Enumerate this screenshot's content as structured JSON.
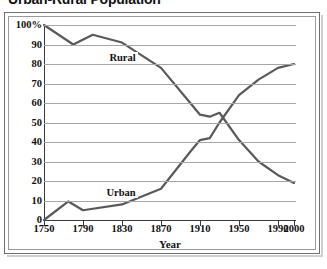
{
  "title": "Urban-Rural Population",
  "chart_data": {
    "type": "line",
    "title": "Urban-Rural Population",
    "xlabel": "Year",
    "ylabel": "",
    "xlim": [
      1750,
      2000
    ],
    "ylim": [
      0,
      100
    ],
    "grid": true,
    "legend": "inline-labels",
    "y_ticks": [
      "100%",
      "90",
      "80",
      "70",
      "60",
      "50",
      "40",
      "30",
      "20",
      "10",
      "0"
    ],
    "y_tick_values": [
      100,
      90,
      80,
      70,
      60,
      50,
      40,
      30,
      20,
      10,
      0
    ],
    "x_ticks": [
      "1750",
      "1790",
      "1830",
      "1870",
      "1910",
      "1950",
      "1990",
      "2000"
    ],
    "x_tick_values": [
      1750,
      1790,
      1830,
      1870,
      1910,
      1950,
      1990,
      2000
    ],
    "series": [
      {
        "name": "Rural",
        "color": "#595959",
        "x": [
          1750,
          1780,
          1800,
          1830,
          1870,
          1900,
          1910,
          1920,
          1930,
          1950,
          1970,
          1990,
          2000
        ],
        "values": [
          100,
          90,
          95,
          91,
          78,
          60,
          54,
          53,
          55,
          41,
          30,
          23,
          19
        ]
      },
      {
        "name": "Urban",
        "color": "#595959",
        "x": [
          1750,
          1775,
          1790,
          1830,
          1870,
          1900,
          1910,
          1920,
          1930,
          1950,
          1970,
          1990,
          2000
        ],
        "values": [
          0,
          9.5,
          5,
          8,
          16,
          35,
          41,
          42,
          50,
          64,
          72,
          78,
          80
        ]
      }
    ],
    "annotations": [
      {
        "text": "Rural",
        "x": 1815,
        "y": 83
      },
      {
        "text": "Urban",
        "x": 1812,
        "y": 14
      }
    ]
  }
}
